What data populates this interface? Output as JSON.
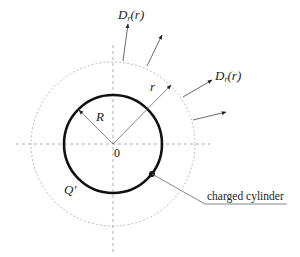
{
  "diagram": {
    "labels": {
      "top_field": "D",
      "top_field_sub": "r",
      "top_field_arg": "(r)",
      "right_field": "D",
      "right_field_sub": "r",
      "right_field_arg": "(r)",
      "outer_radius": "r",
      "inner_radius": "R",
      "origin": "0",
      "charge": "Q'",
      "callout": "charged cylinder"
    },
    "geometry": {
      "center": [
        113,
        144
      ],
      "inner_radius_px": 49,
      "outer_radius_px": 82
    },
    "colors": {
      "line": "#111111",
      "dashed": "#999999"
    }
  }
}
